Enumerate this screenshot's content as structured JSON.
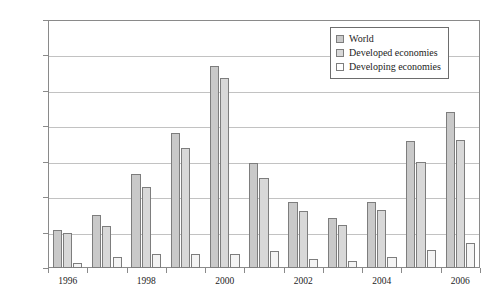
{
  "chart_data": {
    "type": "bar",
    "title": "",
    "subtitle": "",
    "xlabel": "",
    "ylabel": "",
    "grid": true,
    "legend_position": "top-right",
    "ylim": [
      0,
      1400000
    ],
    "ytick_step": 200000,
    "ytick_labels": [
      "1,400,000",
      "1,200,000",
      "1,000,000",
      "800,000",
      "600,000",
      "400,000",
      "200,000"
    ],
    "ytick_values": [
      1400000,
      1200000,
      1000000,
      800000,
      600000,
      400000,
      200000
    ],
    "categories": [
      "1996",
      "1997",
      "1998",
      "1999",
      "2000",
      "2001",
      "2002",
      "2003",
      "2004",
      "2005",
      "2006"
    ],
    "xtick_labels_visible": [
      "1996",
      "1998",
      "2000",
      "2002",
      "2004",
      "2006"
    ],
    "series": [
      {
        "name": "World",
        "color": "#c9c9c9",
        "values": [
          215000,
          300000,
          530000,
          760000,
          1140000,
          595000,
          370000,
          285000,
          375000,
          715000,
          880000
        ]
      },
      {
        "name": "Developed economies",
        "color": "#d8d8d8",
        "values": [
          200000,
          235000,
          460000,
          680000,
          1075000,
          510000,
          320000,
          245000,
          330000,
          600000,
          720000
        ]
      },
      {
        "name": "Developing economies",
        "color": "#ffffff",
        "values": [
          30000,
          60000,
          80000,
          80000,
          80000,
          95000,
          50000,
          40000,
          60000,
          100000,
          140000
        ]
      }
    ]
  },
  "legend": {
    "entries": [
      {
        "label": "World"
      },
      {
        "label": "Developed economies"
      },
      {
        "label": "Developing economies"
      }
    ]
  }
}
